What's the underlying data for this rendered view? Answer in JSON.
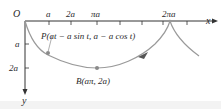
{
  "diagram": {
    "type": "inverted-cycloid",
    "origin_label": "O",
    "x_axis_label": "x",
    "y_axis_label": "y",
    "x_ticks": [
      "a",
      "2a",
      "πa",
      "2πa"
    ],
    "y_ticks": [
      "a",
      "2a"
    ],
    "point_p_label": "P(at − a sin t, a − a cos t)",
    "point_b_label": "B(aπ, 2a)",
    "colors": {
      "curve": "#9a9a9a",
      "axis": "#333333",
      "point": "#8a8a8a",
      "arrow": "#555555"
    }
  }
}
